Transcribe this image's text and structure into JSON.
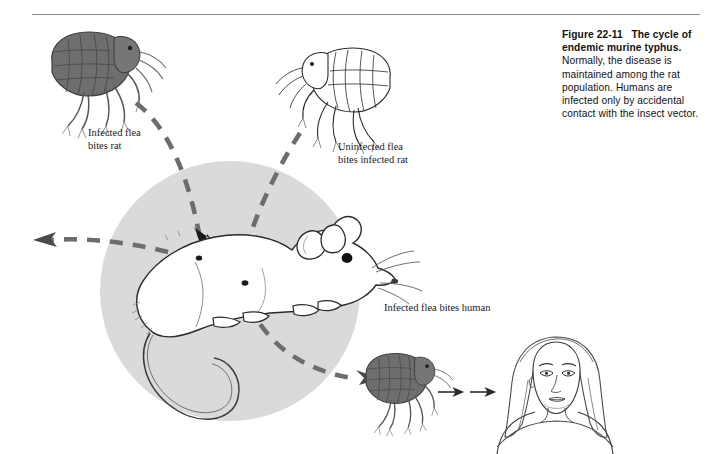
{
  "figure": {
    "top_rule": true,
    "caption": {
      "figure_number": "Figure 22-11",
      "title": "The cycle of endemic murine typhus.",
      "body": "Normally, the disease is maintained among the rat population. Humans are infected only by accidental contact with the insect vector."
    },
    "labels": {
      "infected_flea_bites_rat": "Infected flea\nbites rat",
      "uninfected_flea_bites_infected_rat": "Uninfected flea\nbites infected rat",
      "infected_flea_bites_human": "Infected flea bites human"
    },
    "illustration": {
      "circle_fill": "#d9dbdb",
      "dash_color": "#6d6d6d",
      "arrowhead_color": "#1a1a1a",
      "infected_flea_fill": "#6e6e6e",
      "infected_flea_stroke": "#3a3a3a",
      "uninfected_flea_fill": "#ffffff",
      "uninfected_flea_stroke": "#2a2a2a",
      "rat_fill": "#ffffff",
      "rat_stroke": "#2a2a2a",
      "human_stroke": "#3a3a3a",
      "rule_color": "#8a8a8a",
      "elements": [
        "infected-flea-top-left",
        "uninfected-flea-top-right",
        "rat-in-gray-circle",
        "infected-flea-bottom",
        "human-woman-head-and-shoulders",
        "dashed-cycle-arrows"
      ]
    }
  }
}
